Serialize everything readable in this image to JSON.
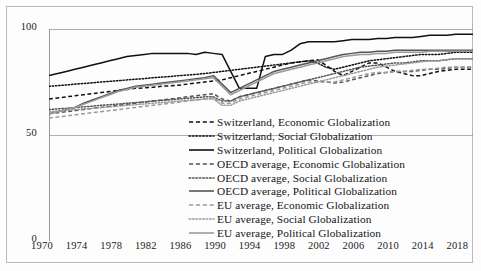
{
  "chart_data": {
    "type": "line",
    "title": "",
    "xlabel": "",
    "ylabel": "",
    "xlim": [
      1970,
      2019
    ],
    "ylim": [
      0,
      100
    ],
    "yticks": [
      0,
      50,
      100
    ],
    "xticks": [
      1970,
      1974,
      1978,
      1982,
      1986,
      1990,
      1994,
      1998,
      2002,
      2006,
      2010,
      2014,
      2018
    ],
    "grid": false,
    "legend_position": "inside-bottom-right",
    "x": [
      1970,
      1971,
      1972,
      1973,
      1974,
      1975,
      1976,
      1977,
      1978,
      1979,
      1980,
      1981,
      1982,
      1983,
      1984,
      1985,
      1986,
      1987,
      1988,
      1989,
      1990,
      1991,
      1992,
      1993,
      1994,
      1995,
      1996,
      1997,
      1998,
      1999,
      2000,
      2001,
      2002,
      2003,
      2004,
      2005,
      2006,
      2007,
      2008,
      2009,
      2010,
      2011,
      2012,
      2013,
      2014,
      2015,
      2016,
      2017,
      2018,
      2019
    ],
    "series": [
      {
        "name": "Switzerland, Economic Globalization",
        "group": "Switzerland",
        "dimension": "Economic Globalization",
        "color": "#111111",
        "style": "dashed",
        "values": [
          67,
          67.5,
          68,
          68.5,
          69,
          69.5,
          70,
          70.5,
          71,
          71.5,
          72,
          72.2,
          72.5,
          73,
          73.2,
          73.5,
          74,
          74.5,
          75,
          75.5,
          76,
          77,
          78,
          79,
          80,
          81,
          82,
          83,
          84,
          84.5,
          85,
          85.5,
          83,
          80,
          78,
          80,
          82,
          84,
          84,
          82,
          80,
          79,
          78,
          78,
          79,
          80,
          80.5,
          81,
          81,
          81
        ]
      },
      {
        "name": "Switzerland, Social Globalization",
        "group": "Switzerland",
        "dimension": "Social Globalization",
        "color": "#111111",
        "style": "dotted",
        "values": [
          73,
          73.3,
          73.6,
          74,
          74.3,
          74.6,
          75,
          75.3,
          75.6,
          76,
          76.3,
          76.6,
          77,
          77.3,
          77.6,
          78,
          78.3,
          78.6,
          79,
          79.5,
          80,
          80.5,
          81,
          81.5,
          82,
          82.5,
          83,
          83.5,
          84,
          84.5,
          85,
          84,
          82,
          81,
          82,
          83,
          84,
          85,
          85.5,
          86,
          86.5,
          87,
          87.5,
          88,
          88,
          88,
          88.5,
          89,
          89,
          89
        ]
      },
      {
        "name": "Switzerland, Political Globalization",
        "group": "Switzerland",
        "dimension": "Political Globalization",
        "color": "#111111",
        "style": "solid",
        "values": [
          78,
          79,
          80,
          81,
          82,
          83,
          84,
          85,
          86,
          87,
          87.5,
          88,
          88.5,
          88.5,
          88.5,
          88.5,
          88.5,
          88,
          89,
          88.5,
          88,
          80,
          72,
          72,
          72,
          87,
          88,
          88,
          90,
          93,
          94,
          94,
          94,
          94,
          94.5,
          95,
          95,
          95,
          95.5,
          95.5,
          96,
          96,
          96,
          96.5,
          97,
          97,
          97,
          97.5,
          97.5,
          97.5
        ]
      },
      {
        "name": "OECD average, Economic Globalization",
        "group": "OECD average",
        "dimension": "Economic Globalization",
        "color": "#555555",
        "style": "dashed",
        "values": [
          60,
          60.5,
          61,
          61.5,
          62,
          62.5,
          63,
          63.5,
          64,
          64.5,
          65,
          65.5,
          66,
          66.5,
          67,
          67.5,
          68,
          68.5,
          69,
          69.5,
          67,
          66,
          68,
          69,
          70,
          71,
          72,
          73,
          74,
          75,
          76,
          75.5,
          75,
          74.5,
          75,
          76,
          77,
          78,
          79,
          79.5,
          80,
          80,
          80,
          80.5,
          81,
          81,
          81.5,
          82,
          82,
          82
        ]
      },
      {
        "name": "OECD average, Social Globalization",
        "group": "OECD average",
        "dimension": "Social Globalization",
        "color": "#555555",
        "style": "dotted",
        "values": [
          62,
          62.3,
          62.6,
          63,
          63.3,
          63.6,
          64,
          64.3,
          64.6,
          65,
          65.3,
          65.6,
          66,
          66.3,
          66.6,
          67,
          67.3,
          67.6,
          68,
          68,
          66,
          66,
          68,
          69,
          70,
          71,
          72,
          73,
          74,
          75,
          76,
          77,
          78,
          79,
          80,
          81,
          82,
          82.5,
          83,
          83.5,
          84,
          84,
          84.5,
          85,
          85,
          85,
          85.5,
          86,
          86,
          86
        ]
      },
      {
        "name": "OECD average, Political Globalization",
        "group": "OECD average",
        "dimension": "Political Globalization",
        "color": "#555555",
        "style": "solid",
        "values": [
          60,
          61,
          62,
          63,
          65,
          66.5,
          68,
          69.5,
          71,
          72,
          73,
          73.5,
          74,
          74.5,
          75,
          75.5,
          76,
          76.5,
          77,
          78,
          74,
          70,
          72,
          74,
          76,
          78,
          80,
          81,
          82,
          83,
          84,
          85,
          86,
          87,
          88,
          88.5,
          89,
          89,
          89.5,
          89.5,
          90,
          90,
          90,
          90,
          90,
          90,
          90,
          90,
          90,
          90
        ]
      },
      {
        "name": "EU average, Economic Globalization",
        "group": "EU average",
        "dimension": "Economic Globalization",
        "color": "#9a9a9a",
        "style": "dashed",
        "values": [
          58,
          58.5,
          59,
          59.5,
          60,
          60.5,
          61,
          61.5,
          62,
          62.5,
          63,
          63.5,
          64,
          64.5,
          65,
          65.5,
          66,
          66.5,
          67,
          67.5,
          65,
          65,
          67,
          68,
          69,
          70,
          71,
          72,
          73,
          74,
          75,
          75,
          75,
          75,
          76,
          77,
          78,
          79,
          79.5,
          79.5,
          80,
          80,
          80.5,
          81,
          81,
          81.5,
          82,
          82,
          82,
          82
        ]
      },
      {
        "name": "EU average, Social Globalization",
        "group": "EU average",
        "dimension": "Social Globalization",
        "color": "#9a9a9a",
        "style": "dotted",
        "values": [
          61,
          61.3,
          61.6,
          62,
          62.3,
          62.6,
          63,
          63.3,
          63.6,
          64,
          64.3,
          64.6,
          65,
          65.3,
          65.6,
          66,
          66.3,
          66.6,
          67,
          67,
          64,
          64,
          66,
          67,
          68,
          69,
          70,
          71,
          72,
          73,
          74,
          75,
          76,
          77,
          78,
          79,
          80,
          81,
          82,
          82.5,
          83,
          83.5,
          84,
          84.5,
          85,
          85,
          85.5,
          86,
          86,
          86
        ]
      },
      {
        "name": "EU average, Political Globalization",
        "group": "EU average",
        "dimension": "Political Globalization",
        "color": "#9a9a9a",
        "style": "solid",
        "values": [
          60,
          61,
          62,
          63,
          64.5,
          66,
          67.5,
          69,
          70.5,
          71.5,
          72.5,
          73,
          73.5,
          74,
          74.5,
          75,
          75.5,
          76,
          76.5,
          77,
          73,
          69,
          71,
          73,
          75,
          77,
          79,
          80,
          81,
          82,
          83,
          84,
          85,
          86,
          87,
          87.5,
          88,
          88,
          88.5,
          88.5,
          89,
          89,
          89,
          89,
          89.5,
          89.5,
          89.5,
          89.5,
          89.5,
          89.5
        ]
      }
    ]
  },
  "axes": {
    "y_tick_labels": [
      "100",
      "50",
      "0"
    ],
    "x_tick_labels": [
      "1970",
      "1974",
      "1978",
      "1982",
      "1986",
      "1990",
      "1994",
      "1998",
      "2002",
      "2006",
      "2010",
      "2014",
      "2018"
    ]
  },
  "legend": {
    "items": [
      {
        "label": "Switzerland, Economic Globalization",
        "color": "#111111",
        "style": "dashed"
      },
      {
        "label": "Switzerland, Social Globalization",
        "color": "#111111",
        "style": "dotted"
      },
      {
        "label": "Switzerland, Political Globalization",
        "color": "#111111",
        "style": "solid"
      },
      {
        "label": "OECD average, Economic Globalization",
        "color": "#555555",
        "style": "dashed"
      },
      {
        "label": "OECD average, Social Globalization",
        "color": "#555555",
        "style": "dotted"
      },
      {
        "label": "OECD average, Political Globalization",
        "color": "#555555",
        "style": "solid"
      },
      {
        "label": "EU average, Economic Globalization",
        "color": "#9a9a9a",
        "style": "dashed"
      },
      {
        "label": "EU average, Social Globalization",
        "color": "#9a9a9a",
        "style": "dotted"
      },
      {
        "label": "EU average, Political Globalization",
        "color": "#9a9a9a",
        "style": "solid"
      }
    ]
  }
}
